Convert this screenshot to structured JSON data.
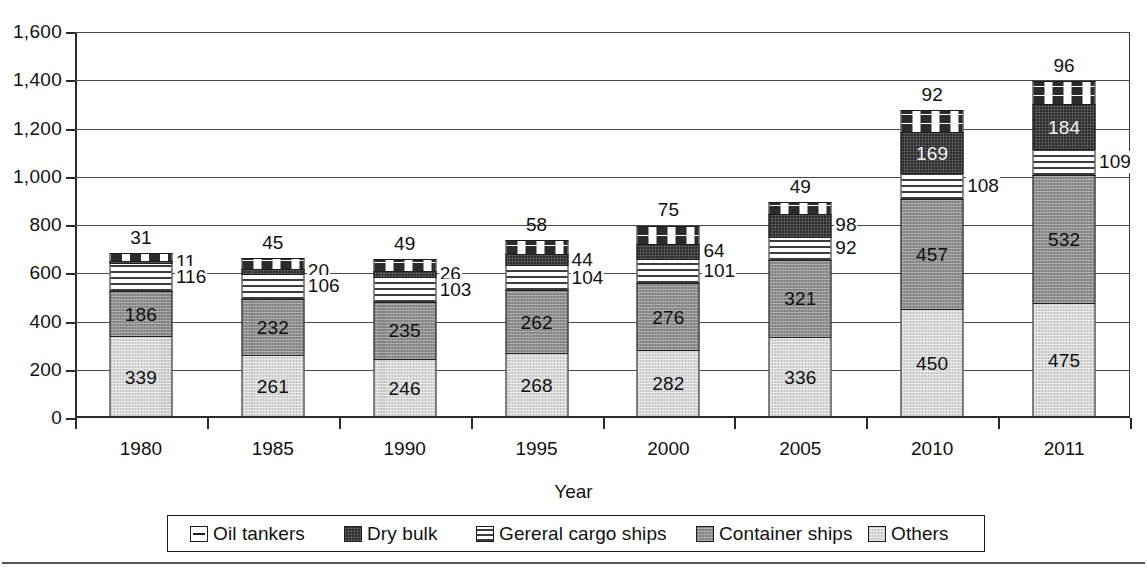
{
  "chart_data": {
    "type": "bar",
    "subtype": "stacked-vertical",
    "title": "",
    "xlabel": "Year",
    "ylabel": "",
    "categories": [
      "1980",
      "1985",
      "1990",
      "1995",
      "2000",
      "2005",
      "2010",
      "2011"
    ],
    "ylim": [
      0,
      1600
    ],
    "ytick_labels": [
      "0",
      "200",
      "400",
      "600",
      "800",
      "1,000",
      "1,200",
      "1,400",
      "1,600"
    ],
    "ytick_values": [
      0,
      200,
      400,
      600,
      800,
      1000,
      1200,
      1400,
      1600
    ],
    "grid": true,
    "grid_axis": "y",
    "legend_position": "bottom",
    "stack_order_bottom_to_top": [
      "Others",
      "Container ships",
      "Gereral cargo ships",
      "Dry bulk",
      "Oil tankers"
    ],
    "series": [
      {
        "name": "Others",
        "color": "#d8d8d8",
        "pattern": "light-stipple",
        "values": [
          339,
          261,
          246,
          268,
          282,
          336,
          450,
          475
        ]
      },
      {
        "name": "Container ships",
        "color": "#8f8f8f",
        "pattern": "medium-stipple",
        "values": [
          186,
          232,
          235,
          262,
          276,
          321,
          457,
          532
        ]
      },
      {
        "name": "Gereral cargo ships",
        "color": "#ffffff",
        "pattern": "horizontal-lines",
        "values": [
          116,
          106,
          103,
          104,
          101,
          92,
          108,
          109
        ]
      },
      {
        "name": "Dry bulk",
        "color": "#2e2e2e",
        "pattern": "dark-solid",
        "values": [
          11,
          20,
          26,
          44,
          64,
          98,
          169,
          184
        ]
      },
      {
        "name": "Oil tankers",
        "color": "#ffffff",
        "pattern": "dashed",
        "values": [
          31,
          45,
          49,
          58,
          75,
          49,
          92,
          96
        ]
      }
    ],
    "totals": [
      683,
      664,
      659,
      736,
      798,
      896,
      1276,
      1396
    ],
    "label_placement": {
      "note": "Oil tankers values drawn above each bar; Gereral cargo ships and Dry bulk values drawn as callouts to the right of each bar",
      "above_bar_series": "Oil tankers",
      "callout_series": [
        "Dry bulk",
        "Gereral cargo ships"
      ],
      "inside_series": [
        "Others",
        "Container ships"
      ]
    }
  },
  "legend": {
    "items": [
      {
        "label": "Oil tankers",
        "swatch": "oil-tankers-swatch"
      },
      {
        "label": "Dry bulk",
        "swatch": "dry-bulk-swatch"
      },
      {
        "label": "Gereral cargo ships",
        "swatch": "general-cargo-ships-swatch"
      },
      {
        "label": "Container ships",
        "swatch": "container-ships-swatch"
      },
      {
        "label": "Others",
        "swatch": "others-swatch"
      }
    ]
  }
}
